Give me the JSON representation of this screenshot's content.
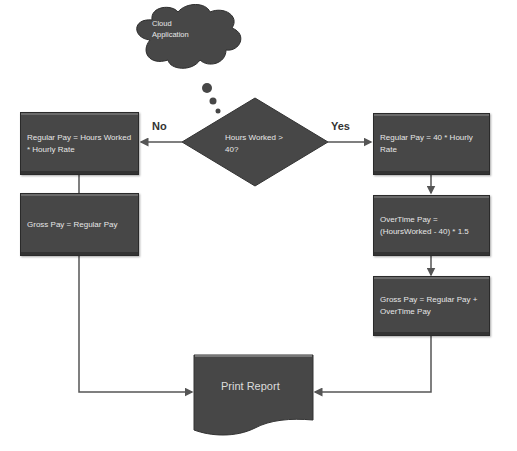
{
  "diagram": {
    "type": "flowchart",
    "colors": {
      "shape_fill": "#474747",
      "shape_text": "#e6e6e6",
      "connector": "#555555",
      "background": "#ffffff"
    },
    "cloud": {
      "label_line1": "Cloud",
      "label_line2": "Application"
    },
    "decision": {
      "label_line1": "Hours Worked >",
      "label_line2": "40?"
    },
    "branch_labels": {
      "no": "No",
      "yes": "Yes"
    },
    "left_branch": [
      {
        "label": "Regular Pay = Hours Worked * Hourly Rate"
      },
      {
        "label": "Gross Pay = Regular Pay"
      }
    ],
    "right_branch": [
      {
        "label": "Regular Pay = 40 * Hourly Rate"
      },
      {
        "label": "OverTime Pay  = (HoursWorked - 40) * 1.5"
      },
      {
        "label": "Gross Pay = Regular Pay + OverTime Pay"
      }
    ],
    "output": {
      "label": "Print Report"
    }
  }
}
